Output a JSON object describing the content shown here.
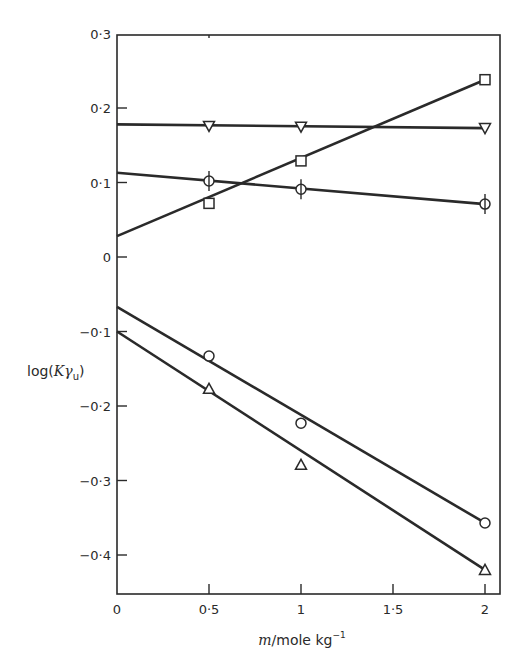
{
  "chart_data": {
    "type": "scatter",
    "title": "",
    "xlabel": "m/mole kg⁻¹",
    "xlabel_parts": {
      "var": "m",
      "unit": "/mole kg",
      "sup": "−1"
    },
    "ylabel": "log(Kγu)",
    "ylabel_parts": {
      "prefix": "log(",
      "var": "Kγ",
      "sub": "u",
      "suffix": ")"
    },
    "xlim": [
      0,
      2.08
    ],
    "ylim": [
      -0.45,
      0.3
    ],
    "x_ticks": [
      0,
      0.5,
      1,
      1.5,
      2
    ],
    "x_tick_labels": [
      "0",
      "0·5",
      "1",
      "1·5",
      "2"
    ],
    "y_ticks": [
      0.3,
      0.2,
      0.1,
      0,
      -0.1,
      -0.2,
      -0.3,
      -0.4
    ],
    "y_tick_labels": [
      "0·3",
      "0·2",
      "0·1",
      "0",
      "−0·1",
      "−0·2",
      "−0·3",
      "−0·4"
    ],
    "grid": false,
    "legend": "none",
    "series": [
      {
        "name": "inverted-triangle",
        "marker": "triangle-down",
        "x": [
          0.5,
          1,
          2
        ],
        "values": [
          0.176,
          0.175,
          0.173
        ],
        "fit": {
          "x0": 0,
          "y0": 0.178,
          "x1": 2,
          "y1": 0.173
        }
      },
      {
        "name": "circle-with-bar",
        "marker": "circle-bar",
        "x": [
          0.5,
          1,
          2
        ],
        "values": [
          0.102,
          0.091,
          0.071
        ],
        "fit": {
          "x0": 0,
          "y0": 0.113,
          "x1": 2,
          "y1": 0.071
        }
      },
      {
        "name": "square",
        "marker": "square",
        "x": [
          0.5,
          1,
          2
        ],
        "values": [
          0.072,
          0.129,
          0.238
        ],
        "fit": {
          "x0": 0,
          "y0": 0.028,
          "x1": 2,
          "y1": 0.238
        }
      },
      {
        "name": "circle",
        "marker": "circle",
        "x": [
          0.5,
          1,
          2
        ],
        "values": [
          -0.133,
          -0.223,
          -0.357
        ],
        "fit": {
          "x0": 0,
          "y0": -0.067,
          "x1": 2,
          "y1": -0.357
        }
      },
      {
        "name": "triangle",
        "marker": "triangle-up",
        "x": [
          0.5,
          1,
          2
        ],
        "values": [
          -0.177,
          -0.279,
          -0.42
        ],
        "fit": {
          "x0": 0,
          "y0": -0.1,
          "x1": 2,
          "y1": -0.42
        }
      }
    ]
  }
}
